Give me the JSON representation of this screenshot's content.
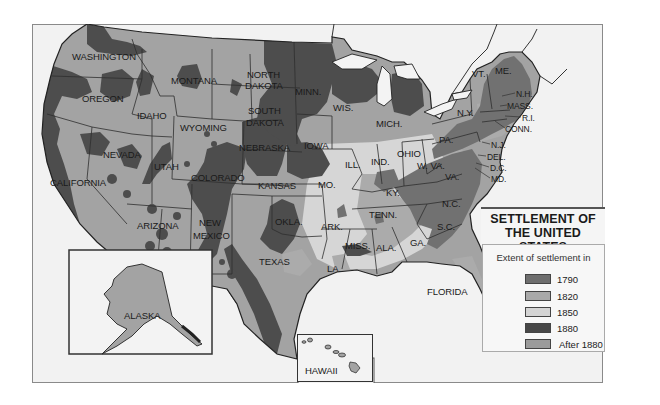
{
  "title": {
    "line1": "SETTLEMENT OF",
    "line2": "THE UNITED STATES"
  },
  "legend": {
    "heading": "Extent of settlement in",
    "items": [
      {
        "label": "1790",
        "color": "#6e6e6e"
      },
      {
        "label": "1820",
        "color": "#a9a9a9"
      },
      {
        "label": "1850",
        "color": "#d4d4d4"
      },
      {
        "label": "1880",
        "color": "#474747"
      },
      {
        "label": "After 1880",
        "color": "#9b9b9b"
      }
    ]
  },
  "colors": {
    "after1880": "#a3a3a3",
    "s1880": "#4d4d4d",
    "s1850": "#d6d6d6",
    "s1820": "#ababab",
    "s1790": "#717171",
    "water": "#f3f3f3",
    "border": "#333333"
  },
  "states": {
    "washington": "WASHINGTON",
    "oregon": "OREGON",
    "california": "CALIFORNIA",
    "nevada": "NEVADA",
    "idaho": "IDAHO",
    "montana": "MONTANA",
    "wyoming": "WYOMING",
    "utah": "UTAH",
    "colorado": "COLORADO",
    "arizona": "ARIZONA",
    "new_mexico_1": "NEW",
    "new_mexico_2": "MEXICO",
    "north_dakota_1": "NORTH",
    "north_dakota_2": "DAKOTA",
    "south_dakota_1": "SOUTH",
    "south_dakota_2": "DAKOTA",
    "nebraska": "NEBRASKA",
    "kansas": "KANSAS",
    "oklahoma": "OKLA.",
    "texas": "TEXAS",
    "minnesota": "MINN.",
    "iowa": "IOWA",
    "missouri": "MO.",
    "arkansas": "ARK.",
    "louisiana": "LA.",
    "wisconsin": "WIS.",
    "illinois": "ILL.",
    "michigan": "MICH.",
    "indiana": "IND.",
    "ohio": "OHIO",
    "kentucky": "KY.",
    "tennessee": "TENN.",
    "mississippi": "MISS.",
    "alabama": "ALA.",
    "georgia": "GA.",
    "florida": "FLORIDA",
    "south_carolina": "S.C.",
    "north_carolina": "N.C.",
    "virginia": "VA.",
    "west_virginia": "W. VA.",
    "pennsylvania": "PA.",
    "new_york": "N.Y.",
    "vermont": "VT.",
    "maine": "ME.",
    "new_hampshire": "N.H.",
    "massachusetts": "MASS.",
    "rhode_island": "R.I.",
    "connecticut": "CONN.",
    "new_jersey": "N.J.",
    "delaware": "DEL.",
    "dc": "D.C.",
    "maryland": "MD.",
    "alaska": "ALASKA",
    "hawaii": "HAWAII"
  }
}
